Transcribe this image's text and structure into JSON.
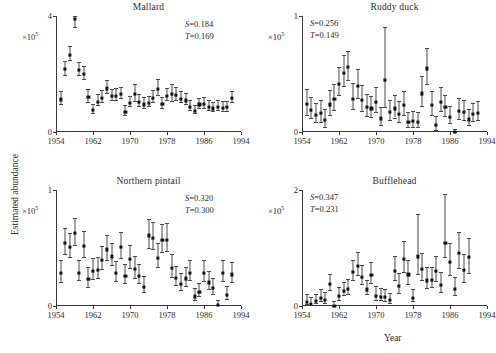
{
  "figure": {
    "xlabel": "Year",
    "ylabel": "Estimated abundance",
    "exponent_prefix": "×10",
    "exponent_power": "5"
  },
  "chart_data": [
    {
      "type": "scatter",
      "title": "Mallard",
      "xlabel": "Year",
      "ylabel": "Estimated abundance",
      "y_scale": "×10^5",
      "xlim": [
        1954,
        1994
      ],
      "ylim": [
        0,
        4
      ],
      "xticks": [
        1954,
        1962,
        1970,
        1978,
        1986,
        1994
      ],
      "yticks": [
        0,
        4
      ],
      "grid": false,
      "annotations": {
        "S": "S=0.184",
        "T": "T=0.169"
      },
      "error_type": "confidence interval",
      "x": [
        1955,
        1956,
        1957,
        1958,
        1959,
        1960,
        1961,
        1962,
        1963,
        1964,
        1965,
        1966,
        1967,
        1968,
        1969,
        1970,
        1971,
        1972,
        1973,
        1974,
        1975,
        1976,
        1977,
        1978,
        1979,
        1980,
        1981,
        1982,
        1983,
        1984,
        1985,
        1986,
        1987,
        1988,
        1989,
        1990,
        1991,
        1992
      ],
      "values": [
        1.17,
        2.22,
        2.72,
        3.95,
        2.18,
        2.05,
        1.26,
        0.8,
        1.1,
        1.22,
        1.55,
        1.28,
        1.3,
        1.35,
        0.75,
        1.05,
        1.36,
        1.08,
        1.0,
        1.05,
        1.22,
        1.53,
        1.02,
        1.3,
        1.35,
        1.33,
        1.2,
        1.14,
        0.92,
        0.78,
        1.0,
        1.02,
        0.92,
        0.86,
        0.92,
        0.88,
        0.9,
        1.22
      ],
      "err_low": [
        0.95,
        1.98,
        2.47,
        3.62,
        1.96,
        1.82,
        1.05,
        0.66,
        0.92,
        1.02,
        1.34,
        1.1,
        1.1,
        1.16,
        0.6,
        0.88,
        1.08,
        0.88,
        0.82,
        0.88,
        1.02,
        1.26,
        0.84,
        1.1,
        1.08,
        1.12,
        1.02,
        0.96,
        0.76,
        0.64,
        0.84,
        0.84,
        0.76,
        0.72,
        0.76,
        0.72,
        0.74,
        1.04
      ],
      "err_high": [
        1.4,
        2.46,
        2.97,
        4.28,
        2.42,
        2.28,
        1.48,
        0.95,
        1.3,
        1.44,
        1.78,
        1.48,
        1.52,
        1.56,
        0.92,
        1.24,
        1.66,
        1.3,
        1.2,
        1.24,
        1.44,
        1.82,
        1.22,
        1.52,
        1.64,
        1.56,
        1.4,
        1.34,
        1.1,
        0.94,
        1.18,
        1.22,
        1.1,
        1.02,
        1.1,
        1.06,
        1.08,
        1.42
      ]
    },
    {
      "type": "scatter",
      "title": "Ruddy duck",
      "xlabel": "Year",
      "ylabel": "Estimated abundance",
      "y_scale": "×10^5",
      "xlim": [
        1954,
        1994
      ],
      "ylim": [
        0,
        1
      ],
      "xticks": [
        1954,
        1962,
        1970,
        1978,
        1986,
        1994
      ],
      "yticks": [
        0,
        1
      ],
      "grid": false,
      "annotations": {
        "S": "S=0.256",
        "T": "T=0.149"
      },
      "error_type": "confidence interval",
      "x": [
        1955,
        1956,
        1957,
        1958,
        1959,
        1960,
        1961,
        1962,
        1963,
        1964,
        1965,
        1966,
        1967,
        1968,
        1969,
        1970,
        1971,
        1972,
        1973,
        1974,
        1975,
        1976,
        1977,
        1978,
        1979,
        1980,
        1981,
        1982,
        1983,
        1984,
        1985,
        1986,
        1987,
        1988,
        1989,
        1990,
        1991,
        1992
      ],
      "values": [
        0.255,
        0.205,
        0.16,
        0.175,
        0.115,
        0.25,
        0.295,
        0.43,
        0.52,
        0.57,
        0.3,
        0.41,
        0.29,
        0.225,
        0.215,
        0.275,
        0.13,
        0.46,
        0.185,
        0.215,
        0.17,
        0.245,
        0.1,
        0.105,
        0.1,
        0.345,
        0.56,
        0.245,
        0.072,
        0.275,
        0.225,
        0.145,
        0.01,
        0.195,
        0.185,
        0.12,
        0.165,
        0.175
      ],
      "err_low": [
        0.15,
        0.12,
        0.085,
        0.09,
        0.045,
        0.15,
        0.19,
        0.32,
        0.4,
        0.45,
        0.195,
        0.29,
        0.185,
        0.14,
        0.13,
        0.175,
        0.06,
        0.215,
        0.1,
        0.125,
        0.085,
        0.15,
        0.04,
        0.045,
        0.04,
        0.225,
        0.415,
        0.15,
        0.015,
        0.18,
        0.14,
        0.08,
        0.002,
        0.115,
        0.105,
        0.06,
        0.095,
        0.1
      ],
      "err_high": [
        0.37,
        0.3,
        0.25,
        0.275,
        0.2,
        0.36,
        0.41,
        0.56,
        0.66,
        0.7,
        0.42,
        0.54,
        0.405,
        0.325,
        0.31,
        0.39,
        0.215,
        0.905,
        0.28,
        0.32,
        0.265,
        0.355,
        0.175,
        0.18,
        0.17,
        0.48,
        0.72,
        0.355,
        0.14,
        0.385,
        0.32,
        0.225,
        0.03,
        0.29,
        0.275,
        0.195,
        0.25,
        0.265
      ]
    },
    {
      "type": "scatter",
      "title": "Northern pintail",
      "xlabel": "Year",
      "ylabel": "Estimated abundance",
      "y_scale": "×10^5",
      "xlim": [
        1954,
        1994
      ],
      "ylim": [
        0,
        1
      ],
      "xticks": [
        1954,
        1962,
        1970,
        1978,
        1986,
        1994
      ],
      "yticks": [
        0,
        1
      ],
      "grid": false,
      "annotations": {
        "S": "S=0.320",
        "T": "T=0.300"
      },
      "error_type": "confidence interval",
      "x": [
        1955,
        1956,
        1957,
        1958,
        1959,
        1960,
        1961,
        1962,
        1963,
        1964,
        1965,
        1966,
        1967,
        1968,
        1969,
        1970,
        1971,
        1972,
        1973,
        1974,
        1975,
        1976,
        1977,
        1978,
        1979,
        1980,
        1981,
        1982,
        1983,
        1984,
        1985,
        1986,
        1987,
        1988,
        1989,
        1990,
        1991,
        1992
      ],
      "values": [
        0.295,
        0.555,
        0.52,
        0.64,
        0.3,
        0.53,
        0.245,
        0.315,
        0.325,
        0.41,
        0.5,
        0.44,
        0.295,
        0.52,
        0.27,
        0.42,
        0.33,
        0.275,
        0.18,
        0.62,
        0.6,
        0.43,
        0.58,
        0.585,
        0.34,
        0.255,
        0.205,
        0.25,
        0.3,
        0.095,
        0.135,
        0.3,
        0.215,
        0.165,
        0.02,
        0.295,
        0.11,
        0.285
      ],
      "err_low": [
        0.21,
        0.445,
        0.42,
        0.53,
        0.22,
        0.42,
        0.165,
        0.235,
        0.245,
        0.32,
        0.4,
        0.35,
        0.215,
        0.415,
        0.195,
        0.325,
        0.245,
        0.2,
        0.12,
        0.5,
        0.49,
        0.335,
        0.465,
        0.47,
        0.25,
        0.18,
        0.14,
        0.175,
        0.22,
        0.05,
        0.085,
        0.215,
        0.145,
        0.105,
        0.005,
        0.215,
        0.06,
        0.205
      ],
      "err_high": [
        0.395,
        0.675,
        0.63,
        0.76,
        0.395,
        0.65,
        0.34,
        0.41,
        0.42,
        0.515,
        0.615,
        0.545,
        0.39,
        0.64,
        0.36,
        0.53,
        0.43,
        0.365,
        0.255,
        0.75,
        0.725,
        0.54,
        0.71,
        0.715,
        0.445,
        0.345,
        0.285,
        0.34,
        0.395,
        0.155,
        0.2,
        0.4,
        0.3,
        0.24,
        0.05,
        0.395,
        0.175,
        0.38
      ]
    },
    {
      "type": "scatter",
      "title": "Bufflehead",
      "xlabel": "Year",
      "ylabel": "Estimated abundance",
      "y_scale": "×10^5",
      "xlim": [
        1954,
        1994
      ],
      "ylim": [
        0,
        2
      ],
      "xticks": [
        1954,
        1962,
        1970,
        1978,
        1986,
        1994
      ],
      "yticks": [
        0,
        2
      ],
      "grid": false,
      "annotations": {
        "S": "S=0.347",
        "T": "T=0.231"
      },
      "error_type": "confidence interval",
      "x": [
        1955,
        1956,
        1957,
        1958,
        1959,
        1960,
        1961,
        1962,
        1963,
        1964,
        1965,
        1966,
        1967,
        1968,
        1969,
        1970,
        1971,
        1972,
        1973,
        1974,
        1975,
        1976,
        1977,
        1978,
        1979,
        1980,
        1981,
        1982,
        1983,
        1984,
        1985,
        1986,
        1987,
        1988,
        1989,
        1990,
        1991,
        1992
      ],
      "values": [
        0.1,
        0.065,
        0.105,
        0.17,
        0.135,
        0.4,
        0.03,
        0.195,
        0.285,
        0.32,
        0.605,
        0.72,
        0.52,
        0.31,
        0.555,
        0.205,
        0.185,
        0.175,
        0.125,
        0.63,
        0.37,
        0.84,
        0.57,
        0.16,
        0.88,
        0.66,
        0.465,
        0.47,
        0.63,
        0.39,
        1.11,
        0.79,
        0.32,
        0.94,
        0.64,
        0.87
      ],
      "err_low": [
        0.035,
        0.02,
        0.045,
        0.09,
        0.06,
        0.28,
        0.008,
        0.11,
        0.185,
        0.21,
        0.44,
        0.54,
        0.375,
        0.205,
        0.395,
        0.11,
        0.095,
        0.09,
        0.06,
        0.44,
        0.225,
        0.58,
        0.385,
        0.085,
        0.56,
        0.455,
        0.31,
        0.32,
        0.435,
        0.245,
        0.85,
        0.53,
        0.195,
        0.66,
        0.42,
        0.57
      ],
      "err_high": [
        0.2,
        0.155,
        0.205,
        0.29,
        0.25,
        0.545,
        0.08,
        0.32,
        0.42,
        0.47,
        0.8,
        0.93,
        0.7,
        0.45,
        0.76,
        0.345,
        0.31,
        0.3,
        0.23,
        0.86,
        0.57,
        1.12,
        0.8,
        0.29,
        1.58,
        0.92,
        0.67,
        0.67,
        0.86,
        0.58,
        1.93,
        1.08,
        0.5,
        1.27,
        0.89,
        1.17
      ]
    }
  ]
}
